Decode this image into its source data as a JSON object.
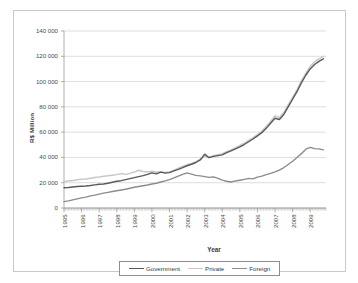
{
  "chart_data": {
    "type": "line",
    "title": "",
    "xlabel": "Year",
    "ylabel": "R$ Million",
    "xlim": [
      1995,
      2009.9
    ],
    "ylim": [
      0,
      140000
    ],
    "grid": true,
    "legend_position": "bottom",
    "y_ticks": [
      "0",
      "20 000",
      "40 000",
      "60 000",
      "80 000",
      "100 000",
      "120 000",
      "140 000"
    ],
    "y_tick_values": [
      0,
      20000,
      40000,
      60000,
      80000,
      100000,
      120000,
      140000
    ],
    "x_ticks": [
      "1995",
      "1996",
      "1997",
      "1998",
      "1999",
      "2000",
      "2001",
      "2002",
      "2003",
      "2004",
      "2005",
      "2006",
      "2007",
      "2008",
      "2009"
    ],
    "colors": {
      "government": "#5a5a5a",
      "private": "#c8c8c8",
      "foreign": "#8c8c8c",
      "gridline": "#cfcfcf",
      "axis": "#9a9a9a",
      "frame": "#c9c9c9",
      "text": "#4a4a4a"
    },
    "series": [
      {
        "name": "Government",
        "color": "#5a5a5a",
        "x": [
          1995.0,
          1995.25,
          1995.5,
          1995.75,
          1996.0,
          1996.25,
          1996.5,
          1996.75,
          1997.0,
          1997.25,
          1997.5,
          1997.75,
          1998.0,
          1998.25,
          1998.5,
          1998.75,
          1999.0,
          1999.25,
          1999.5,
          1999.75,
          2000.0,
          2000.25,
          2000.5,
          2000.75,
          2001.0,
          2001.25,
          2001.5,
          2001.75,
          2002.0,
          2002.25,
          2002.5,
          2002.75,
          2003.0,
          2003.25,
          2003.5,
          2003.75,
          2004.0,
          2004.25,
          2004.5,
          2004.75,
          2005.0,
          2005.25,
          2005.5,
          2005.75,
          2006.0,
          2006.25,
          2006.5,
          2006.75,
          2007.0,
          2007.25,
          2007.5,
          2007.75,
          2008.0,
          2008.25,
          2008.5,
          2008.75,
          2009.0,
          2009.25,
          2009.5,
          2009.75
        ],
        "values": [
          16000,
          16200,
          16600,
          17000,
          17200,
          17400,
          17800,
          18300,
          18800,
          19000,
          19600,
          20400,
          21200,
          21600,
          22400,
          23200,
          24000,
          24800,
          25600,
          26600,
          27800,
          27000,
          28400,
          27600,
          28000,
          29400,
          30600,
          32000,
          33400,
          34600,
          36000,
          38000,
          42600,
          39800,
          40800,
          41400,
          42000,
          43800,
          45200,
          46800,
          48400,
          50200,
          52400,
          54600,
          57000,
          59600,
          63000,
          67000,
          71000,
          70000,
          74000,
          80000,
          86000,
          92000,
          99000,
          105000,
          110000,
          113500,
          116000,
          118000
        ]
      },
      {
        "name": "Private",
        "color": "#c8c8c8",
        "x": [
          1995.0,
          1995.25,
          1995.5,
          1995.75,
          1996.0,
          1996.25,
          1996.5,
          1996.75,
          1997.0,
          1997.25,
          1997.5,
          1997.75,
          1998.0,
          1998.25,
          1998.5,
          1998.75,
          1999.0,
          1999.25,
          1999.5,
          1999.75,
          2000.0,
          2000.25,
          2000.5,
          2000.75,
          2001.0,
          2001.25,
          2001.5,
          2001.75,
          2002.0,
          2002.25,
          2002.5,
          2002.75,
          2003.0,
          2003.25,
          2003.5,
          2003.75,
          2004.0,
          2004.25,
          2004.5,
          2004.75,
          2005.0,
          2005.25,
          2005.5,
          2005.75,
          2006.0,
          2006.25,
          2006.5,
          2006.75,
          2007.0,
          2007.25,
          2007.5,
          2007.75,
          2008.0,
          2008.25,
          2008.5,
          2008.75,
          2009.0,
          2009.25,
          2009.5,
          2009.75
        ],
        "values": [
          21000,
          21400,
          21800,
          22400,
          22800,
          23000,
          23600,
          24200,
          24600,
          25200,
          25600,
          26000,
          26400,
          27200,
          26600,
          27400,
          28400,
          29800,
          28800,
          28400,
          29000,
          28200,
          28600,
          28000,
          28400,
          29800,
          31400,
          32800,
          34200,
          35200,
          36400,
          38600,
          41000,
          40200,
          41400,
          42200,
          43000,
          44600,
          46000,
          47600,
          49400,
          51200,
          53400,
          55600,
          58000,
          60800,
          64400,
          68400,
          73000,
          71500,
          75500,
          81500,
          87500,
          93500,
          100500,
          106500,
          112000,
          115500,
          118000,
          120000
        ]
      },
      {
        "name": "Foreign",
        "color": "#8c8c8c",
        "x": [
          1995.0,
          1995.25,
          1995.5,
          1995.75,
          1996.0,
          1996.25,
          1996.5,
          1996.75,
          1997.0,
          1997.25,
          1997.5,
          1997.75,
          1998.0,
          1998.25,
          1998.5,
          1998.75,
          1999.0,
          1999.25,
          1999.5,
          1999.75,
          2000.0,
          2000.25,
          2000.5,
          2000.75,
          2001.0,
          2001.25,
          2001.5,
          2001.75,
          2002.0,
          2002.25,
          2002.5,
          2002.75,
          2003.0,
          2003.25,
          2003.5,
          2003.75,
          2004.0,
          2004.25,
          2004.5,
          2004.75,
          2005.0,
          2005.25,
          2005.5,
          2005.75,
          2006.0,
          2006.25,
          2006.5,
          2006.75,
          2007.0,
          2007.25,
          2007.5,
          2007.75,
          2008.0,
          2008.25,
          2008.5,
          2008.75,
          2009.0,
          2009.25,
          2009.5,
          2009.75
        ],
        "values": [
          5000,
          5600,
          6400,
          7200,
          8000,
          8600,
          9600,
          10200,
          11000,
          11800,
          12400,
          13000,
          13600,
          14200,
          14800,
          15600,
          16400,
          17000,
          17600,
          18200,
          19000,
          19600,
          20600,
          21400,
          22400,
          23800,
          25200,
          26600,
          27800,
          26800,
          25800,
          25400,
          24800,
          24200,
          24600,
          23400,
          22000,
          21200,
          20600,
          21400,
          22000,
          22600,
          23400,
          23000,
          24400,
          25200,
          26400,
          27400,
          28600,
          30000,
          32000,
          34400,
          37000,
          40000,
          43000,
          46500,
          48000,
          47000,
          46800,
          46000
        ]
      }
    ]
  }
}
